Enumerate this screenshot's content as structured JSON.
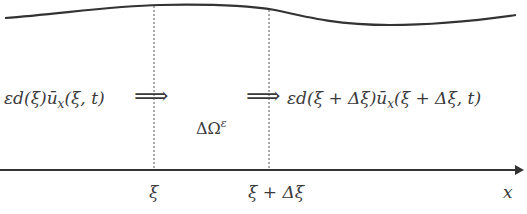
{
  "diagram": {
    "left_flux_label": "εd(ξ)ū",
    "left_flux_sub": "x",
    "left_flux_args": "(ξ, t)",
    "right_flux_label": "εd(ξ + Δξ)ū",
    "right_flux_sub": "x",
    "right_flux_args": "(ξ + Δξ, t)",
    "arrow_glyph": "⟹",
    "domain_label": "ΔΩ",
    "domain_sup": "ε",
    "axis_label": "x",
    "tick_1": "ξ",
    "tick_2": "ξ + Δξ",
    "colors": {
      "stroke": "#333333",
      "dotted": "#555555",
      "text": "#3a3a3a"
    }
  }
}
